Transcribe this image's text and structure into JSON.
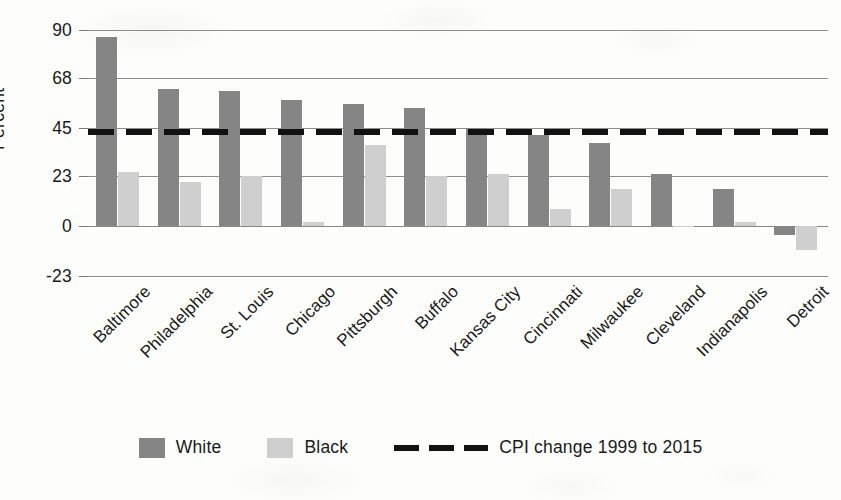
{
  "chart_data": {
    "type": "bar",
    "title": "",
    "xlabel": "",
    "ylabel": "Percent",
    "ylim": [
      -23,
      90
    ],
    "yticks": [
      90,
      68,
      45,
      23,
      0,
      -23
    ],
    "ytick_labels": [
      "90",
      "68",
      "45",
      "23",
      "0",
      "-23"
    ],
    "grid": true,
    "legend_position": "bottom",
    "categories": [
      "Baltimore",
      "Philadelphia",
      "St. Louis",
      "Chicago",
      "Pittsburgh",
      "Buffalo",
      "Kansas City",
      "Cincinnati",
      "Milwaukee",
      "Cleveland",
      "Indianapolis",
      "Detroit"
    ],
    "series": [
      {
        "name": "White",
        "color": "#858585",
        "values": [
          87,
          63,
          62,
          58,
          56,
          54,
          45,
          42,
          38,
          24,
          17,
          -4
        ]
      },
      {
        "name": "Black",
        "color": "#cfcfcf",
        "values": [
          25,
          20,
          23,
          2,
          37,
          23,
          24,
          8,
          17,
          0,
          2,
          -11
        ]
      }
    ],
    "reference_line": {
      "label": "CPI change 1999 to 2015",
      "value": 43,
      "style": "dashed",
      "color": "#121212"
    }
  },
  "legend": {
    "items": [
      {
        "label": "White",
        "swatch": "white-swatch"
      },
      {
        "label": "Black",
        "swatch": "black-swatch"
      },
      {
        "label": "CPI change 1999 to 2015",
        "swatch": "dashed-line-swatch"
      }
    ]
  }
}
